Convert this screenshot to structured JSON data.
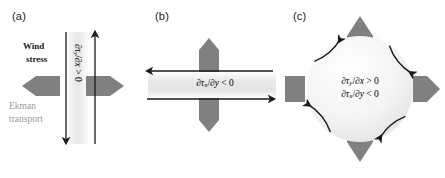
{
  "figure": {
    "background": "#ffffff",
    "arrow_gray": "#808080",
    "line_black": "#1a1a1a",
    "label_gray": "#9a9a9a"
  },
  "panels": [
    {
      "id": "a",
      "label": "(a)",
      "annotations": {
        "wind_stress_line1": "Wind",
        "wind_stress_line2": "stress",
        "ekman_line1": "Ekman",
        "ekman_line2": "transport"
      },
      "equation": {
        "numerator": "∂τ",
        "numerator_sub": "y",
        "denominator": "∂x",
        "slash": "/",
        "relation": "> 0",
        "full": "∂τy/∂x > 0"
      },
      "black_arrows": [
        {
          "name": "left-wind-stress-arrow",
          "direction": "down"
        },
        {
          "name": "right-wind-stress-arrow",
          "direction": "up"
        }
      ],
      "gray_arrows": [
        {
          "name": "ekman-transport-arrow-left",
          "direction": "left"
        },
        {
          "name": "ekman-transport-arrow-right",
          "direction": "right"
        }
      ]
    },
    {
      "id": "b",
      "label": "(b)",
      "equation": {
        "numerator": "∂τ",
        "numerator_sub": "x",
        "denominator": "∂y",
        "slash": "/",
        "relation": "< 0",
        "full": "∂τx/∂y < 0"
      },
      "black_arrows": [
        {
          "name": "top-wind-stress-arrow",
          "direction": "left"
        },
        {
          "name": "bottom-wind-stress-arrow",
          "direction": "right"
        }
      ],
      "gray_arrows": [
        {
          "name": "ekman-transport-arrow-up",
          "direction": "up"
        },
        {
          "name": "ekman-transport-arrow-down",
          "direction": "down"
        }
      ]
    },
    {
      "id": "c",
      "label": "(c)",
      "equations": [
        {
          "full": "∂τy/∂x > 0",
          "numerator": "∂τ",
          "numerator_sub": "y",
          "denominator": "∂x",
          "relation": "> 0"
        },
        {
          "full": "∂τx/∂y < 0",
          "numerator": "∂τ",
          "numerator_sub": "x",
          "denominator": "∂y",
          "relation": "< 0"
        }
      ],
      "circulation": "counterclockwise",
      "curved_arrows": [
        {
          "name": "curved-arrow-upper-left",
          "direction": "counterclockwise"
        },
        {
          "name": "curved-arrow-upper-right",
          "direction": "counterclockwise"
        },
        {
          "name": "curved-arrow-lower-left",
          "direction": "counterclockwise"
        },
        {
          "name": "curved-arrow-lower-right",
          "direction": "counterclockwise"
        }
      ],
      "gray_arrows": [
        {
          "name": "ekman-transport-arrow-up",
          "direction": "up"
        },
        {
          "name": "ekman-transport-arrow-right",
          "direction": "right"
        },
        {
          "name": "ekman-transport-arrow-down",
          "direction": "down"
        },
        {
          "name": "ekman-transport-arrow-left",
          "direction": "left"
        }
      ]
    }
  ]
}
